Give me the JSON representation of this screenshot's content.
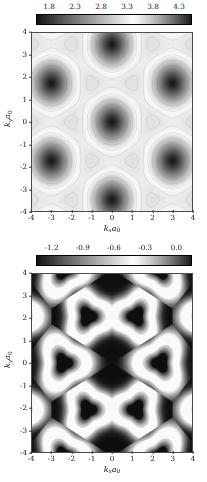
{
  "figure": {
    "panels": [
      {
        "id": "panel-top",
        "colorbar": {
          "ticks": [
            "1.8",
            "2.3",
            "2.8",
            "3.3",
            "3.8",
            "4.3"
          ],
          "vmin": 1.55,
          "vmax": 4.55,
          "orientation": "horizontal",
          "colormap": "gray-cyclic"
        },
        "axes": {
          "xlabel_main": "k",
          "xlabel_sub": "x",
          "xlabel_a": "a",
          "xlabel_a_sub": "0",
          "ylabel_main": "k",
          "ylabel_sub": "y",
          "ylabel_a": "a",
          "ylabel_a_sub": "0",
          "xticks": [
            "-4",
            "-3",
            "-2",
            "-1",
            "0",
            "1",
            "2",
            "3",
            "4"
          ],
          "yticks": [
            "4",
            "3",
            "2",
            "1",
            "0",
            "-1",
            "-2",
            "-3",
            "-4"
          ],
          "xlim": [
            -4,
            4
          ],
          "ylim": [
            -4,
            4
          ]
        }
      },
      {
        "id": "panel-bottom",
        "colorbar": {
          "ticks": [
            "-1.2",
            "-0.9",
            "-0.6",
            "-0.3",
            "0.0"
          ],
          "vmin": -1.35,
          "vmax": 0.12,
          "orientation": "horizontal",
          "colormap": "gray-cyclic"
        },
        "axes": {
          "xlabel_main": "k",
          "xlabel_sub": "x",
          "xlabel_a": "a",
          "xlabel_a_sub": "0",
          "ylabel_main": "k",
          "ylabel_sub": "y",
          "ylabel_a": "a",
          "ylabel_a_sub": "0",
          "xticks": [
            "-4",
            "-3",
            "-2",
            "-1",
            "0",
            "1",
            "2",
            "3",
            "4"
          ],
          "yticks": [
            "4",
            "3",
            "2",
            "1",
            "0",
            "-1",
            "-2",
            "-3",
            "-4"
          ],
          "xlim": [
            -4,
            4
          ],
          "ylim": [
            -4,
            4
          ]
        }
      }
    ]
  },
  "chart_data": [
    {
      "type": "heatmap",
      "title": "",
      "xlabel": "k_x a_0",
      "ylabel": "k_y a_0",
      "xlim": [
        -4,
        4
      ],
      "ylim": [
        -4,
        4
      ],
      "xticks": [
        -4,
        -3,
        -2,
        -1,
        0,
        1,
        2,
        3,
        4
      ],
      "yticks": [
        -4,
        -3,
        -2,
        -1,
        0,
        1,
        2,
        3,
        4
      ],
      "colorbar_ticks": [
        1.8,
        2.3,
        2.8,
        3.3,
        3.8,
        4.3
      ],
      "zmin": 1.55,
      "zmax": 4.55,
      "colormap": "gray",
      "grid": false,
      "legend": "none",
      "description": "Upper conduction band energy over the hexagonal reciprocal lattice; dark circular minima on a triangular lattice, light ridges between them, dashed contour lines overlaid.",
      "lattice": {
        "type": "triangular",
        "a1": [
          3.0,
          0.0
        ],
        "a2": [
          1.5,
          2.598
        ],
        "minima_value": 1.55,
        "maxima_value": 4.55,
        "minima_sites": [
          [
            -3.0,
            0.0
          ],
          [
            0.0,
            0.0
          ],
          [
            3.0,
            0.0
          ],
          [
            -4.5,
            2.598
          ],
          [
            -1.5,
            2.598
          ],
          [
            1.5,
            2.598
          ],
          [
            4.5,
            2.598
          ],
          [
            -4.5,
            -2.598
          ],
          [
            -1.5,
            -2.598
          ],
          [
            1.5,
            -2.598
          ],
          [
            4.5,
            -2.598
          ],
          [
            -3.0,
            5.196
          ],
          [
            0.0,
            5.196
          ],
          [
            3.0,
            5.196
          ],
          [
            -3.0,
            -5.196
          ],
          [
            0.0,
            -5.196
          ],
          [
            3.0,
            -5.196
          ]
        ]
      }
    },
    {
      "type": "heatmap",
      "title": "",
      "xlabel": "k_x a_0",
      "ylabel": "k_y a_0",
      "xlim": [
        -4,
        4
      ],
      "ylim": [
        -4,
        4
      ],
      "xticks": [
        -4,
        -3,
        -2,
        -1,
        0,
        1,
        2,
        3,
        4
      ],
      "yticks": [
        -4,
        -3,
        -2,
        -1,
        0,
        1,
        2,
        3,
        4
      ],
      "colorbar_ticks": [
        -1.2,
        -0.9,
        -0.6,
        -0.3,
        0.0
      ],
      "zmin": -1.35,
      "zmax": 0.12,
      "colormap": "gray",
      "grid": false,
      "legend": "none",
      "description": "Lower valence band energy over the hexagonal reciprocal lattice; bright triangular rings surround dark point-like minima at honeycomb K-points, background dark.",
      "lattice": {
        "type": "honeycomb",
        "a1": [
          3.6,
          0.0
        ],
        "a2": [
          1.8,
          3.118
        ],
        "ring_radius": 0.95,
        "bright_value": 0.0,
        "dark_value": -1.35,
        "ring_centers": [
          [
            -2.4,
            0.0
          ],
          [
            2.4,
            0.0
          ],
          [
            -1.2,
            2.078
          ],
          [
            1.2,
            2.078
          ],
          [
            -1.2,
            -2.078
          ],
          [
            1.2,
            -2.078
          ],
          [
            -2.4,
            4.157
          ],
          [
            2.4,
            4.157
          ],
          [
            -2.4,
            -4.157
          ],
          [
            2.4,
            -4.157
          ],
          [
            -4.8,
            2.078
          ],
          [
            4.8,
            2.078
          ],
          [
            -4.8,
            -2.078
          ],
          [
            4.8,
            -2.078
          ]
        ]
      }
    }
  ]
}
